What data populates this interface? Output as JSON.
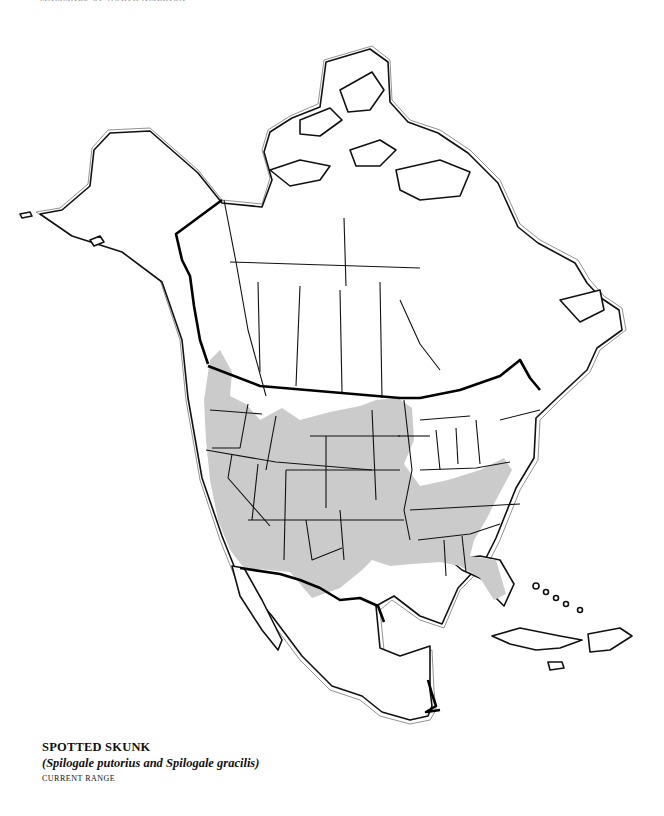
{
  "header": {
    "text": "MAMMALS OF NORTH AMERICA",
    "visible": "cut off at top edge"
  },
  "map": {
    "region": "North America",
    "style": "black-and-white outline map with coastline halo",
    "colors": {
      "land": "#ffffff",
      "outline": "#111111",
      "range_fill": "#cbcbcb",
      "background": "#ffffff"
    },
    "shaded_area": {
      "label": "Current range",
      "description": "Western and central United States from Pacific coast east to Mississippi valley and Appalachians, south through Texas, Gulf coast and Florida, plus southwestern British Columbia"
    }
  },
  "legend": {
    "title": "SPOTTED SKUNK",
    "species": "(Spilogale putorius and Spilogale gracilis)",
    "subtitle": "CURRENT RANGE"
  }
}
